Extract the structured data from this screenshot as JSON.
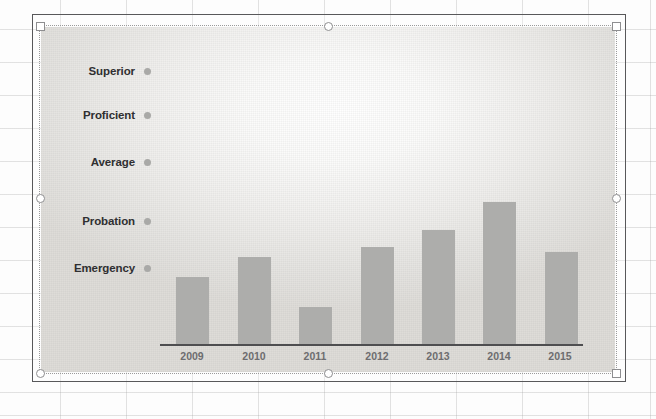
{
  "chart_data": {
    "type": "bar",
    "title": "",
    "subtitle": "",
    "xlabel": "",
    "ylabel": "",
    "grid": false,
    "legend_position": "left-axis",
    "categories": [
      "2009",
      "2010",
      "2011",
      "2012",
      "2013",
      "2014",
      "2015"
    ],
    "values": [
      2,
      2.4,
      1.3,
      2.6,
      3,
      3.6,
      2.5
    ],
    "y_categories": [
      "Superior",
      "Proficient",
      "Average",
      "Probation",
      "Emergency"
    ],
    "ylim": [
      0,
      5
    ],
    "series": [
      {
        "name": "Rating",
        "values": [
          2,
          2.4,
          1.3,
          2.6,
          3,
          3.6,
          2.5
        ]
      }
    ],
    "bar_color": "#adadab",
    "axis_color": "#4e4e50"
  },
  "chart": {
    "y_axis": {
      "labels": [
        {
          "text": "Superior",
          "y": 72,
          "value": 5
        },
        {
          "text": "Proficient",
          "y": 116,
          "value": 4
        },
        {
          "text": "Average",
          "y": 163,
          "value": 3
        },
        {
          "text": "Probation",
          "y": 222,
          "value": 2
        },
        {
          "text": "Emergency",
          "y": 269,
          "value": 1
        }
      ]
    },
    "x_axis": {
      "ticks": [
        {
          "label": "2009",
          "x": 192
        },
        {
          "label": "2010",
          "x": 254
        },
        {
          "label": "2011",
          "x": 315
        },
        {
          "label": "2012",
          "x": 377
        },
        {
          "label": "2013",
          "x": 438
        },
        {
          "label": "2014",
          "x": 499
        },
        {
          "label": "2015",
          "x": 560
        }
      ]
    },
    "bars": [
      {
        "year": "2009",
        "left": 176,
        "width": 33,
        "top": 277,
        "height": 68
      },
      {
        "year": "2010",
        "left": 238,
        "width": 33,
        "top": 257,
        "height": 88
      },
      {
        "year": "2011",
        "left": 299,
        "width": 33,
        "top": 307,
        "height": 38
      },
      {
        "year": "2012",
        "left": 361,
        "width": 33,
        "top": 247,
        "height": 98
      },
      {
        "year": "2013",
        "left": 422,
        "width": 33,
        "top": 230,
        "height": 115
      },
      {
        "year": "2014",
        "left": 483,
        "width": 33,
        "top": 202,
        "height": 143
      },
      {
        "year": "2015",
        "left": 545,
        "width": 33,
        "top": 252,
        "height": 93
      }
    ]
  },
  "selection": {
    "handles": [
      {
        "name": "handle-top-left",
        "left": 36,
        "top": 22,
        "shape": "square"
      },
      {
        "name": "handle-top-center",
        "left": 324,
        "top": 22,
        "shape": "round"
      },
      {
        "name": "handle-top-right",
        "left": 612,
        "top": 22,
        "shape": "square"
      },
      {
        "name": "handle-middle-left",
        "left": 36,
        "top": 194,
        "shape": "round"
      },
      {
        "name": "handle-middle-right",
        "left": 612,
        "top": 194,
        "shape": "round"
      },
      {
        "name": "handle-bottom-left",
        "left": 36,
        "top": 369,
        "shape": "round"
      },
      {
        "name": "handle-bottom-center",
        "left": 324,
        "top": 369,
        "shape": "round"
      },
      {
        "name": "handle-bottom-right",
        "left": 612,
        "top": 369,
        "shape": "square"
      }
    ]
  },
  "plot_geometry": {
    "axis_left": 160,
    "axis_width": 423,
    "axis_top": 344
  }
}
